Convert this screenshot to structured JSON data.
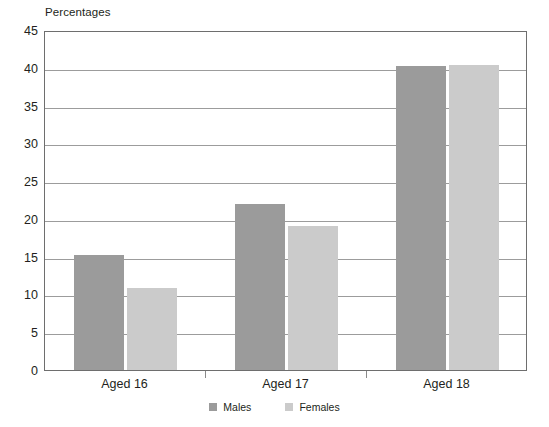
{
  "chart_data": {
    "type": "bar",
    "title": "Percentages",
    "xlabel": "",
    "ylabel": "",
    "ylim": [
      0,
      45
    ],
    "yticks": [
      0,
      5,
      10,
      15,
      20,
      25,
      30,
      35,
      40,
      45
    ],
    "grid": true,
    "legend_position": "bottom",
    "categories": [
      "Aged 16",
      "Aged 17",
      "Aged 18"
    ],
    "series": [
      {
        "name": "Males",
        "color": "#9b9b9b",
        "values": [
          15.2,
          22.0,
          40.3
        ]
      },
      {
        "name": "Females",
        "color": "#cbcbcb",
        "values": [
          10.8,
          19.0,
          40.4
        ]
      }
    ]
  }
}
